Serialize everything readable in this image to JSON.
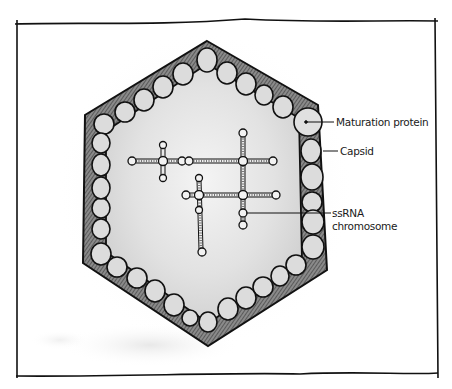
{
  "diagram": {
    "labels": {
      "maturation_protein": "Maturation protein",
      "capsid": "Capsid",
      "ssrna_line1": "ssRNA",
      "ssrna_line2": "chromosome"
    },
    "colors": {
      "ink": "#111111",
      "capsid_shell": "#6b6b6b",
      "capsomer_fill": "#d9d9d9",
      "interior_wash": "#e6e6e6",
      "background": "#ffffff"
    }
  }
}
